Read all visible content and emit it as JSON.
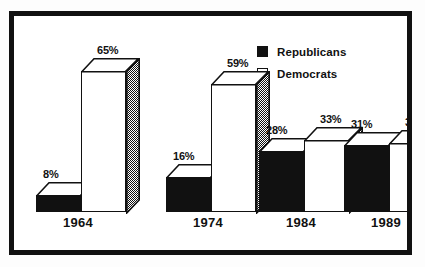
{
  "chart_data": {
    "type": "bar",
    "title": "",
    "subtitle": "",
    "xlabel": "",
    "ylabel": "",
    "ylim": [
      0,
      70
    ],
    "grid": false,
    "legend_position": "top-right",
    "categories": [
      "1964",
      "1974",
      "1984",
      "1989"
    ],
    "series": [
      {
        "name": "Republicans",
        "color": "#111111",
        "values": [
          8,
          16,
          28,
          31
        ],
        "labels": [
          "8%",
          "16%",
          "28%",
          "31%"
        ]
      },
      {
        "name": "Democrats",
        "color": "#ffffff",
        "values": [
          65,
          59,
          33,
          32
        ],
        "labels": [
          "65%",
          "59%",
          "33%",
          "32%"
        ]
      }
    ]
  },
  "legend": {
    "items": [
      {
        "label": "Republicans",
        "swatch": "filled-square"
      },
      {
        "label": "Democrats",
        "swatch": "outlined-square"
      }
    ]
  },
  "axis": {
    "year_labels": [
      "1964",
      "1974",
      "1984",
      "1989"
    ]
  },
  "groups": [
    {
      "year": "1964",
      "republican": {
        "label": "8%",
        "value": 8
      },
      "democrat": {
        "label": "65%",
        "value": 65
      }
    },
    {
      "year": "1974",
      "republican": {
        "label": "16%",
        "value": 16
      },
      "democrat": {
        "label": "59%",
        "value": 59
      }
    },
    {
      "year": "1984",
      "republican": {
        "label": "28%",
        "value": 28
      },
      "democrat": {
        "label": "33%",
        "value": 33
      }
    },
    {
      "year": "1989",
      "republican": {
        "label": "31%",
        "value": 31
      },
      "democrat": {
        "label": "32%",
        "value": 32
      }
    }
  ]
}
